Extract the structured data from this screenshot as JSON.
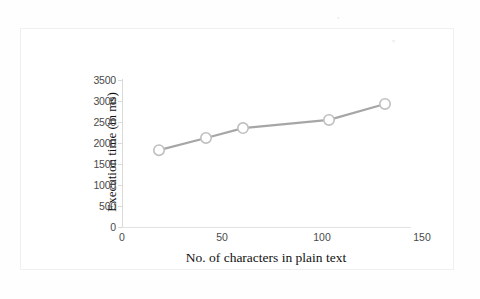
{
  "chart_data": {
    "type": "line",
    "title": "",
    "xlabel": "No. of characters in plain text",
    "ylabel": "Execution time (in ms)",
    "x": [
      18.5,
      42,
      60.5,
      103.5,
      131.5
    ],
    "values": [
      1830,
      2120,
      2355,
      2550,
      2930
    ],
    "series": [
      {
        "name": "Execution time",
        "x": [
          18.5,
          42,
          60.5,
          103.5,
          131.5
        ],
        "values": [
          1830,
          2120,
          2355,
          2550,
          2930
        ]
      }
    ],
    "xlim": [
      0,
      150
    ],
    "ylim": [
      0,
      3500
    ],
    "xticks": [
      0,
      50,
      100,
      150
    ],
    "yticks": [
      0,
      500,
      1000,
      1500,
      2000,
      2500,
      3000,
      3500
    ],
    "xtick_labels": [
      "0",
      "50",
      "100",
      "150"
    ],
    "ytick_labels": [
      "0",
      "500",
      "1000",
      "1500",
      "2000",
      "2500",
      "3000",
      "3500"
    ],
    "grid": false,
    "legend": false,
    "legend_position": "none",
    "line_color": "#a6a6a6",
    "marker_color": "#ffffff",
    "marker_edge_color": "#bfbfbf",
    "marker_shape": "circle",
    "axis_color": "#d9d9d9",
    "text_color": "#4a4a4a"
  },
  "figure": {
    "background": "#ffffff",
    "border_color": "#f0f0f0",
    "artifacts": [
      "·",
      "·"
    ]
  }
}
